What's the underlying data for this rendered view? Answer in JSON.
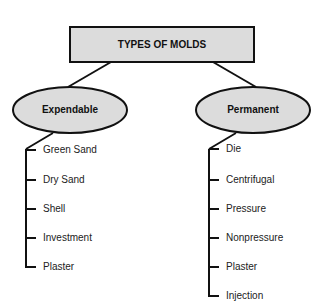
{
  "diagram": {
    "root": {
      "label": "TYPES OF MOLDS",
      "fill": "#dcdcdc"
    },
    "branches": [
      {
        "label": "Expendable",
        "fill": "#dcdcdc",
        "items": [
          "Green Sand",
          "Dry Sand",
          "Shell",
          "Investment",
          "Plaster"
        ]
      },
      {
        "label": "Permanent",
        "fill": "#dcdcdc",
        "items": [
          "Die",
          "Centrifugal",
          "Pressure",
          "Nonpressure",
          "Plaster",
          "Injection"
        ]
      }
    ]
  }
}
